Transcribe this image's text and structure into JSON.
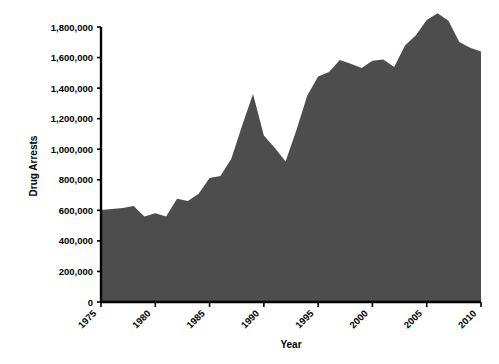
{
  "chart_data": {
    "type": "area",
    "title": "",
    "xlabel": "Year",
    "ylabel": "Drug Arrests",
    "xlim": [
      1975,
      2010
    ],
    "ylim": [
      0,
      1800000
    ],
    "grid": false,
    "legend": null,
    "fill_color": "#4d4d4d",
    "axis_color": "#000000",
    "background_color": "#ffffff",
    "x_tick_labels": [
      "1975",
      "1980",
      "1985",
      "1990",
      "1995",
      "2000",
      "2005",
      "2010"
    ],
    "x_tick_values": [
      1975,
      1980,
      1985,
      1990,
      1995,
      2000,
      2005,
      2010
    ],
    "y_tick_labels": [
      "0",
      "200,000",
      "400,000",
      "600,000",
      "800,000",
      "1,000,000",
      "1,200,000",
      "1,400,000",
      "1,600,000",
      "1,800,000"
    ],
    "y_tick_values": [
      0,
      200000,
      400000,
      600000,
      800000,
      1000000,
      1200000,
      1400000,
      1600000,
      1800000
    ],
    "x": [
      1975,
      1976,
      1977,
      1978,
      1979,
      1980,
      1981,
      1982,
      1983,
      1984,
      1985,
      1986,
      1987,
      1988,
      1989,
      1990,
      1991,
      1992,
      1993,
      1994,
      1995,
      1996,
      1997,
      1998,
      1999,
      2000,
      2001,
      2002,
      2003,
      2004,
      2005,
      2006,
      2007,
      2008,
      2009,
      2010
    ],
    "values": [
      601400,
      609000,
      616000,
      628000,
      559000,
      580900,
      560000,
      676000,
      661000,
      708000,
      811400,
      824000,
      937000,
      1155200,
      1361700,
      1089500,
      1010000,
      919600,
      1126300,
      1351400,
      1476100,
      1506200,
      1583600,
      1559100,
      1532200,
      1579566,
      1586902,
      1538813,
      1678192,
      1745712,
      1846351,
      1889810,
      1841182,
      1702537,
      1663582,
      1638846
    ]
  },
  "axes": {
    "y_axis_title": "Drug Arrests",
    "x_axis_title": "Year"
  }
}
